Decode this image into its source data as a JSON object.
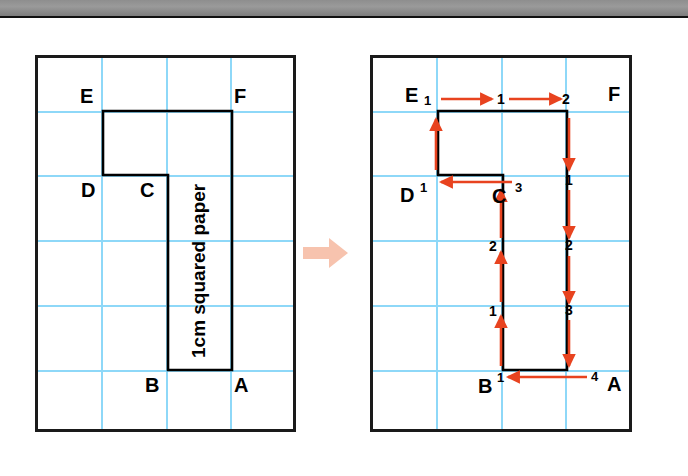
{
  "page": {
    "background_color": "#ffffff",
    "topbar_color": "#8e8e8e"
  },
  "colors": {
    "grid_line": "#8ed8f8",
    "frame_border": "#1a1a1a",
    "shape_outline": "#000000",
    "arrow_red": "#e8431f",
    "transition_arrow": "#f7c3ae",
    "label_text": "#000000"
  },
  "grid": {
    "columns": 4,
    "rows": 6,
    "cell_size_px": 65,
    "unit_label": "1cm"
  },
  "left_diagram": {
    "name": "compound-shape-unlabelled",
    "caption": "1cm squared paper",
    "vertex_labels": [
      {
        "id": "E",
        "text": "E",
        "x": 80,
        "y": 86
      },
      {
        "id": "F",
        "text": "F",
        "x": 234,
        "y": 86
      },
      {
        "id": "D",
        "text": "D",
        "x": 81,
        "y": 180
      },
      {
        "id": "C",
        "text": "C",
        "x": 140,
        "y": 180
      },
      {
        "id": "B",
        "text": "B",
        "x": 145,
        "y": 375
      },
      {
        "id": "A",
        "text": "A",
        "x": 234,
        "y": 375
      }
    ],
    "shape_points": "103,111 232,111 232,370 168,370 168,175 103,175"
  },
  "right_diagram": {
    "name": "compound-shape-perimeter-counted",
    "vertex_labels": [
      {
        "id": "E",
        "text": "E",
        "x": 405,
        "y": 85
      },
      {
        "id": "F",
        "text": "F",
        "x": 608,
        "y": 84
      },
      {
        "id": "D",
        "text": "D",
        "x": 400,
        "y": 185
      },
      {
        "id": "C",
        "text": "C",
        "x": 492,
        "y": 186
      },
      {
        "id": "B",
        "text": "B",
        "x": 478,
        "y": 376
      },
      {
        "id": "A",
        "text": "A",
        "x": 607,
        "y": 374
      }
    ],
    "superscripts": [
      {
        "id": "E-sup",
        "text": "1",
        "x": 424,
        "y": 94
      },
      {
        "id": "D-sup",
        "text": "1",
        "x": 420,
        "y": 181
      },
      {
        "id": "C-sup",
        "text": "3",
        "x": 515,
        "y": 181
      },
      {
        "id": "B-sup",
        "text": "1",
        "x": 497,
        "y": 371
      },
      {
        "id": "A-sup",
        "text": "4",
        "x": 591,
        "y": 370
      }
    ],
    "counts": [
      {
        "id": "top-count-1",
        "text": "1",
        "x": 497,
        "y": 97
      },
      {
        "id": "top-count-2",
        "text": "2",
        "x": 562,
        "y": 97
      },
      {
        "id": "right-count-1",
        "text": "1",
        "x": 565,
        "y": 180
      },
      {
        "id": "right-count-2",
        "text": "2",
        "x": 565,
        "y": 244
      },
      {
        "id": "right-count-3",
        "text": "3",
        "x": 565,
        "y": 309
      },
      {
        "id": "left-count-2",
        "text": "2",
        "x": 489,
        "y": 245
      },
      {
        "id": "left-count-1",
        "text": "1",
        "x": 489,
        "y": 310
      }
    ],
    "shape_points": "438,111 567,111 567,370 503,370 503,175 438,175",
    "arrows": [
      {
        "id": "arrow-E-to-1",
        "direction": "right",
        "x1": 441,
        "y1": 99,
        "x2": 492,
        "y2": 99
      },
      {
        "id": "arrow-1-to-F",
        "direction": "right",
        "x1": 509,
        "y1": 99,
        "x2": 561,
        "y2": 99
      },
      {
        "id": "arrow-F-down-1",
        "direction": "down",
        "x1": 569,
        "y1": 118,
        "x2": 569,
        "y2": 170
      },
      {
        "id": "arrow-down-2",
        "direction": "down",
        "x1": 569,
        "y1": 190,
        "x2": 569,
        "y2": 238
      },
      {
        "id": "arrow-down-3",
        "direction": "down",
        "x1": 569,
        "y1": 256,
        "x2": 569,
        "y2": 303
      },
      {
        "id": "arrow-down-4",
        "direction": "down",
        "x1": 569,
        "y1": 320,
        "x2": 569,
        "y2": 366
      },
      {
        "id": "arrow-A-to-B",
        "direction": "left",
        "x1": 587,
        "y1": 377,
        "x2": 508,
        "y2": 377
      },
      {
        "id": "arrow-B-up-1",
        "direction": "up",
        "x1": 501,
        "y1": 366,
        "x2": 501,
        "y2": 316
      },
      {
        "id": "arrow-up-2",
        "direction": "up",
        "x1": 501,
        "y1": 302,
        "x2": 501,
        "y2": 252
      },
      {
        "id": "arrow-up-3",
        "direction": "up",
        "x1": 501,
        "y1": 238,
        "x2": 501,
        "y2": 190
      },
      {
        "id": "arrow-C-to-D",
        "direction": "left",
        "x1": 512,
        "y1": 182,
        "x2": 441,
        "y2": 182
      },
      {
        "id": "arrow-D-up",
        "direction": "up",
        "x1": 436,
        "y1": 170,
        "x2": 436,
        "y2": 119
      }
    ]
  },
  "transition": {
    "name": "transition-arrow",
    "direction": "right"
  }
}
